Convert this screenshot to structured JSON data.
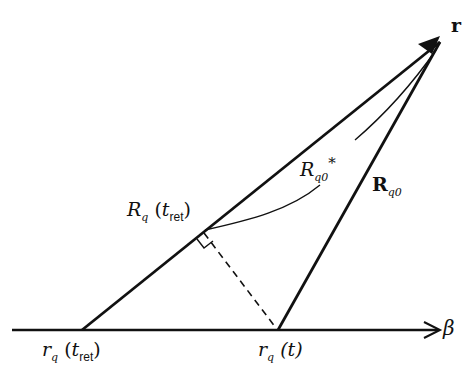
{
  "diagram": {
    "labels": {
      "r": {
        "main": "r"
      },
      "beta": {
        "main": "β"
      },
      "Rq0_bold": {
        "main": "R",
        "sub": "q0"
      },
      "Rq0_star": {
        "main": "R",
        "sub": "q0",
        "sup": "*"
      },
      "Rq_tret": {
        "main": "R",
        "sub": "q",
        "open": "(",
        "var": "t",
        "varsub": "ret",
        "close": ")"
      },
      "rq_tret": {
        "main": "r",
        "sub": "q",
        "open": "(",
        "var": "t",
        "varsub": "ret",
        "close": ")"
      },
      "rq_t": {
        "main": "r",
        "sub": "q",
        "args": "(t)"
      }
    },
    "colors": {
      "stroke": "#111111",
      "background": "#ffffff"
    }
  }
}
